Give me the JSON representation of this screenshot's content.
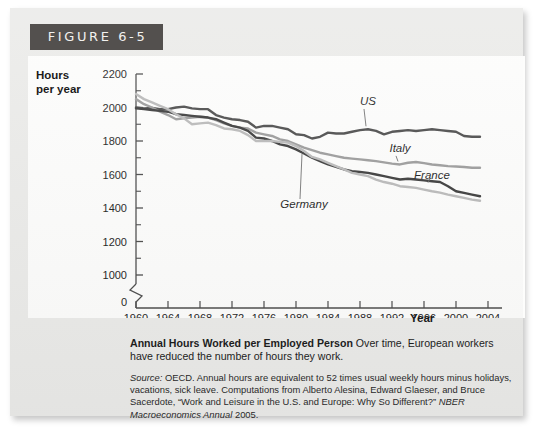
{
  "figure": {
    "badge": "FIGURE 6-5",
    "caption_title": "Annual Hours Worked per Employed Person",
    "caption_body": " Over time, European workers have reduced the number of hours they work.",
    "source_lead": "Source:",
    "source_body": " OECD. Annual hours are equivalent to 52 times usual weekly hours minus holidays, vacations, sick leave. Computations from Alberto Alesina, Edward Glaeser, and Bruce Sacerdote, “Work and Leisure in the U.S. and Europe: Why So Different?” ",
    "source_journal": "NBER Macroeconomics Annual",
    "source_year": " 2005."
  },
  "chart_data": {
    "type": "line",
    "title": "Annual Hours Worked per Employed Person",
    "xlabel": "Year",
    "ylabel": "Hours per year",
    "ylabel_line1": "Hours",
    "ylabel_line2": "per year",
    "xlim": [
      1960,
      2004
    ],
    "ylim": [
      950,
      2250
    ],
    "axis_break": true,
    "axis_break_label": "0",
    "grid": false,
    "legend": "inline-annotations",
    "ytick_labels": [
      "2200",
      "2000",
      "1800",
      "1600",
      "1400",
      "1200",
      "1000"
    ],
    "yticks": [
      2200,
      2000,
      1800,
      1600,
      1400,
      1200,
      1000
    ],
    "yticks_minor": [
      2100,
      1900,
      1700,
      1500,
      1300,
      1100
    ],
    "xtick_labels": [
      "1960",
      "1964",
      "1968",
      "1972",
      "1976",
      "1980",
      "1984",
      "1988",
      "1992",
      "1996",
      "2000",
      "2004"
    ],
    "xticks": [
      1960,
      1964,
      1968,
      1972,
      1976,
      1980,
      1984,
      1988,
      1992,
      1996,
      2000,
      2004
    ],
    "x": [
      1960,
      1961,
      1962,
      1963,
      1964,
      1965,
      1966,
      1967,
      1968,
      1969,
      1970,
      1971,
      1972,
      1973,
      1974,
      1975,
      1976,
      1977,
      1978,
      1979,
      1980,
      1981,
      1982,
      1983,
      1984,
      1985,
      1986,
      1987,
      1988,
      1989,
      1990,
      1991,
      1992,
      1993,
      1994,
      1995,
      1996,
      1997,
      1998,
      1999,
      2000,
      2001,
      2002,
      2003
    ],
    "series": [
      {
        "name": "US",
        "color": "#4b4b4b",
        "width": 2.4,
        "label_x": 1989,
        "label_y": 2015,
        "values": [
          2000,
          1995,
          1998,
          1990,
          1990,
          2000,
          2005,
          1995,
          1990,
          1990,
          1955,
          1940,
          1930,
          1925,
          1915,
          1880,
          1890,
          1890,
          1880,
          1870,
          1840,
          1835,
          1815,
          1825,
          1850,
          1845,
          1845,
          1855,
          1865,
          1870,
          1860,
          1840,
          1855,
          1860,
          1865,
          1860,
          1865,
          1870,
          1865,
          1860,
          1855,
          1830,
          1825,
          1825
        ]
      },
      {
        "name": "Italy",
        "color": "#9b9b9b",
        "width": 2.4,
        "label_x": 1993,
        "label_y": 1735,
        "values": [
          2050,
          2020,
          2000,
          1975,
          1955,
          1930,
          1935,
          1940,
          1945,
          1940,
          1925,
          1905,
          1890,
          1880,
          1875,
          1850,
          1840,
          1830,
          1810,
          1800,
          1780,
          1760,
          1745,
          1730,
          1720,
          1710,
          1700,
          1695,
          1690,
          1685,
          1680,
          1672,
          1665,
          1660,
          1670,
          1675,
          1668,
          1660,
          1655,
          1650,
          1648,
          1645,
          1640,
          1640
        ]
      },
      {
        "name": "France",
        "color": "#3a3a3a",
        "width": 2.4,
        "label_x": 1997,
        "label_y": 1575,
        "values": [
          1995,
          1990,
          1985,
          1980,
          1975,
          1960,
          1955,
          1950,
          1945,
          1940,
          1930,
          1910,
          1890,
          1880,
          1860,
          1820,
          1815,
          1800,
          1780,
          1770,
          1750,
          1725,
          1700,
          1680,
          1660,
          1645,
          1630,
          1620,
          1615,
          1610,
          1600,
          1590,
          1580,
          1570,
          1575,
          1570,
          1565,
          1560,
          1555,
          1530,
          1500,
          1490,
          1480,
          1470
        ]
      },
      {
        "name": "Germany",
        "color": "#b9b9b9",
        "width": 2.4,
        "label_x": 1981,
        "label_y": 1400,
        "values": [
          2080,
          2050,
          2030,
          2010,
          1990,
          1960,
          1935,
          1900,
          1905,
          1910,
          1895,
          1875,
          1870,
          1860,
          1835,
          1800,
          1800,
          1800,
          1795,
          1790,
          1770,
          1740,
          1705,
          1690,
          1670,
          1650,
          1630,
          1610,
          1600,
          1590,
          1570,
          1555,
          1545,
          1530,
          1525,
          1520,
          1510,
          1500,
          1492,
          1480,
          1470,
          1460,
          1450,
          1443
        ]
      }
    ]
  }
}
